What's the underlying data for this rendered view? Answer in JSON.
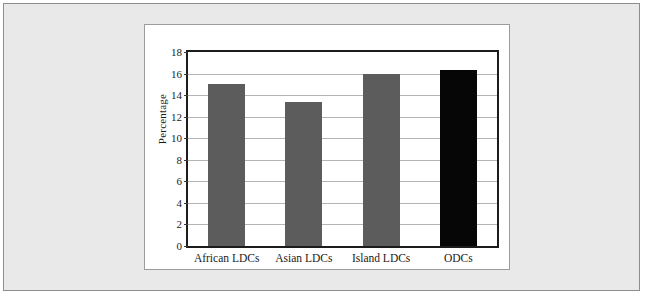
{
  "chart_data": {
    "type": "bar",
    "title": "",
    "subtitle": "",
    "xlabel": "",
    "ylabel": "Percentage",
    "categories": [
      "African LDCs",
      "Asian LDCs",
      "Island LDCs",
      "ODCs"
    ],
    "values": [
      15.0,
      13.4,
      16.0,
      16.3
    ],
    "series": [
      {
        "name": "Percentage",
        "values": [
          15.0,
          13.4,
          16.0,
          16.3
        ],
        "colors": [
          "#5c5c5c",
          "#5c5c5c",
          "#5c5c5c",
          "#060606"
        ]
      }
    ],
    "ylim": [
      0,
      18
    ],
    "ytick_step": 2,
    "ytick_labels": [
      "0",
      "2",
      "4",
      "6",
      "8",
      "10",
      "12",
      "14",
      "16",
      "18"
    ],
    "ytick_values": [
      0,
      2,
      4,
      6,
      8,
      10,
      12,
      14,
      16,
      18
    ],
    "grid": true,
    "grid_axis": "y",
    "legend": false,
    "legend_position": "none",
    "bar_color_default": "#5c5c5c",
    "bar_color_highlight": "#060606",
    "plot_border_color": "#1c1c1c",
    "gridline_color": "#b4b4b4",
    "panel_background": "#ffffff",
    "page_background": "#e9e9e9",
    "frame_border_color": "#8d8d8d"
  }
}
